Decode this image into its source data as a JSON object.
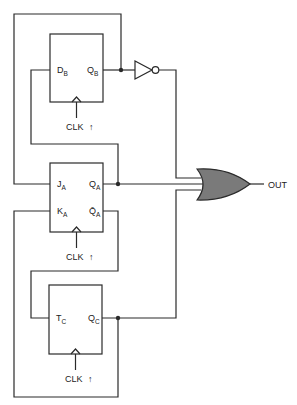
{
  "diagram": {
    "title": "",
    "flip_flops": [
      {
        "id": "B",
        "type": "D",
        "inputs": [
          {
            "name": "D",
            "sub": "B"
          }
        ],
        "outputs": [
          {
            "name": "Q",
            "sub": "B"
          }
        ],
        "clock_label": "CLK",
        "clock_arrow": "↑"
      },
      {
        "id": "A",
        "type": "JK",
        "inputs": [
          {
            "name": "J",
            "sub": "A"
          },
          {
            "name": "K",
            "sub": "A"
          }
        ],
        "outputs": [
          {
            "name": "Q",
            "sub": "A"
          },
          {
            "name": "Q̄",
            "sub": "A"
          }
        ],
        "clock_label": "CLK",
        "clock_arrow": "↑"
      },
      {
        "id": "C",
        "type": "T",
        "inputs": [
          {
            "name": "T",
            "sub": "C"
          }
        ],
        "outputs": [
          {
            "name": "Q",
            "sub": "C"
          }
        ],
        "clock_label": "CLK",
        "clock_arrow": "↑"
      }
    ],
    "gates": [
      {
        "id": "inverter",
        "type": "NOT",
        "input": "QB"
      },
      {
        "id": "or-gate",
        "type": "OR",
        "inputs": [
          "NOT QB",
          "QA",
          "QC"
        ],
        "output": "OUT",
        "fill": "#7a7a7a"
      }
    ],
    "output_label": "OUT",
    "connections": [
      "QB -> NOT -> OR",
      "QB -> JA (top feedback loop)",
      "QA -> DB",
      "QA -> OR",
      "Q̄A -> TC",
      "QC -> OR",
      "QC -> KA (bottom feedback loop)"
    ]
  }
}
